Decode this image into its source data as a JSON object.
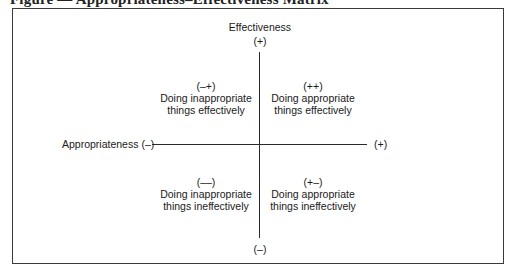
{
  "figure": {
    "caption": "Figure — Appropriateness–Effectiveness Matrix",
    "type": "2x2 matrix diagram"
  },
  "axes": {
    "vertical": {
      "title": "Effectiveness",
      "positive_label": "(+)",
      "negative_label": "(–)"
    },
    "horizontal": {
      "title": "Appropriateness (–)",
      "positive_label": "(+)"
    }
  },
  "quadrants": {
    "top_left": {
      "sign": "(–+)",
      "line1": "Doing inappropriate",
      "line2": "things effectively"
    },
    "top_right": {
      "sign": "(++)",
      "line1": "Doing appropriate",
      "line2": "things effectively"
    },
    "bottom_left": {
      "sign": "(––)",
      "line1": "Doing inappropriate",
      "line2": "things ineffectively"
    },
    "bottom_right": {
      "sign": "(+–)",
      "line1": "Doing appropriate",
      "line2": "things ineffectively"
    }
  },
  "colors": {
    "line": "#2a2a2a",
    "text": "#1a1a1a",
    "background": "#ffffff"
  }
}
